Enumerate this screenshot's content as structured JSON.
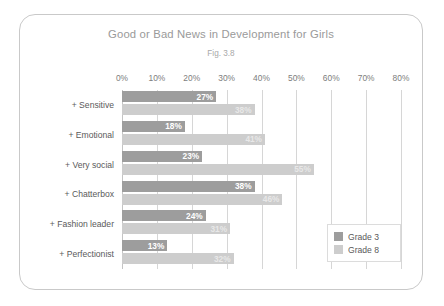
{
  "chart_data": {
    "type": "bar",
    "orientation": "horizontal",
    "title": "Good or Bad News in Development for Girls",
    "subtitle": "Fig. 3.8",
    "xlabel": "",
    "ylabel": "",
    "xlim": [
      0,
      80
    ],
    "xtick_labels": [
      "0%",
      "10%",
      "20%",
      "30%",
      "40%",
      "50%",
      "60%",
      "70%",
      "80%"
    ],
    "xticks": [
      0,
      10,
      20,
      30,
      40,
      50,
      60,
      70,
      80
    ],
    "grid": true,
    "legend_position": "middle-right",
    "categories": [
      "+ Sensitive",
      "+ Emotional",
      "+ Very social",
      "+ Chatterbox",
      "+ Fashion leader",
      "+ Perfectionist"
    ],
    "series": [
      {
        "name": "Grade 3",
        "color": "#9d9d9d",
        "values": [
          27,
          18,
          23,
          38,
          24,
          13
        ],
        "labels": [
          "27%",
          "18%",
          "23%",
          "38%",
          "24%",
          "13%"
        ]
      },
      {
        "name": "Grade 8",
        "color": "#cdcdcd",
        "values": [
          38,
          41,
          55,
          46,
          31,
          32
        ],
        "labels": [
          "38%",
          "41%",
          "55%",
          "46%",
          "31%",
          "32%"
        ]
      }
    ]
  },
  "legend": {
    "items": [
      {
        "label": "Grade 3",
        "color": "#9d9d9d"
      },
      {
        "label": "Grade 8",
        "color": "#cdcdcd"
      }
    ]
  }
}
